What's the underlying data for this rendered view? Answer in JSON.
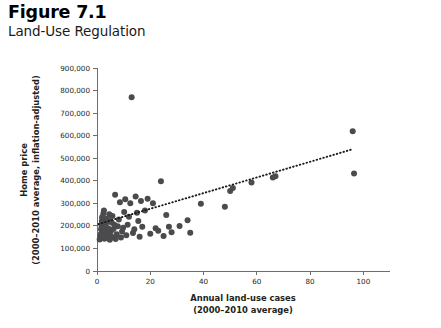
{
  "figure": {
    "number": "Figure 7.1",
    "title": "Land-Use Regulation"
  },
  "chart_data": {
    "type": "scatter",
    "title": "Land-Use Regulation",
    "xlabel_line1": "Annual land-use cases",
    "xlabel_line2": "(2000–2010 average)",
    "ylabel_line1": "Home price",
    "ylabel_line2": "(2000–2010 average, inflation-adjusted)",
    "xlim": [
      0,
      110
    ],
    "ylim": [
      0,
      900000
    ],
    "xticks": [
      0,
      20,
      40,
      60,
      80,
      100
    ],
    "xticklabels": [
      "0",
      "20",
      "40",
      "60",
      "80",
      "100"
    ],
    "yticks": [
      0,
      100000,
      200000,
      300000,
      400000,
      500000,
      600000,
      700000,
      800000,
      900000
    ],
    "yticklabels": [
      "0",
      "100,000",
      "200,000",
      "300,000",
      "400,000",
      "500,000",
      "600,000",
      "700,000",
      "800,000",
      "900,000"
    ],
    "grid": false,
    "legend": false,
    "marker_color": "#4b4b4d",
    "axis_color": "#6d6e71",
    "trendline": {
      "style": "dotted",
      "color": "#1a1a1a",
      "x": [
        0.5,
        96.0
      ],
      "y": [
        208000,
        540000
      ]
    },
    "points": [
      {
        "x": 1.0,
        "y": 140000
      },
      {
        "x": 1.2,
        "y": 152000
      },
      {
        "x": 1.4,
        "y": 163000
      },
      {
        "x": 1.5,
        "y": 185000
      },
      {
        "x": 1.6,
        "y": 205000
      },
      {
        "x": 1.8,
        "y": 222000
      },
      {
        "x": 1.9,
        "y": 238000
      },
      {
        "x": 2.0,
        "y": 148000
      },
      {
        "x": 2.1,
        "y": 172000
      },
      {
        "x": 2.3,
        "y": 196000
      },
      {
        "x": 2.4,
        "y": 255000
      },
      {
        "x": 2.6,
        "y": 268000
      },
      {
        "x": 2.8,
        "y": 143000
      },
      {
        "x": 3.0,
        "y": 158000
      },
      {
        "x": 3.2,
        "y": 180000
      },
      {
        "x": 3.4,
        "y": 212000
      },
      {
        "x": 3.6,
        "y": 232000
      },
      {
        "x": 3.8,
        "y": 146000
      },
      {
        "x": 4.0,
        "y": 168000
      },
      {
        "x": 4.2,
        "y": 190000
      },
      {
        "x": 4.4,
        "y": 225000
      },
      {
        "x": 4.6,
        "y": 252000
      },
      {
        "x": 4.8,
        "y": 138000
      },
      {
        "x": 5.0,
        "y": 155000
      },
      {
        "x": 5.2,
        "y": 176000
      },
      {
        "x": 5.5,
        "y": 215000
      },
      {
        "x": 5.8,
        "y": 244000
      },
      {
        "x": 6.0,
        "y": 150000
      },
      {
        "x": 6.2,
        "y": 186000
      },
      {
        "x": 6.5,
        "y": 205000
      },
      {
        "x": 6.8,
        "y": 338000
      },
      {
        "x": 7.0,
        "y": 142000
      },
      {
        "x": 7.4,
        "y": 163000
      },
      {
        "x": 7.8,
        "y": 198000
      },
      {
        "x": 8.2,
        "y": 228000
      },
      {
        "x": 8.6,
        "y": 305000
      },
      {
        "x": 9.0,
        "y": 148000
      },
      {
        "x": 9.4,
        "y": 175000
      },
      {
        "x": 9.8,
        "y": 192000
      },
      {
        "x": 10.2,
        "y": 262000
      },
      {
        "x": 10.6,
        "y": 318000
      },
      {
        "x": 11.0,
        "y": 158000
      },
      {
        "x": 11.5,
        "y": 205000
      },
      {
        "x": 12.0,
        "y": 240000
      },
      {
        "x": 12.5,
        "y": 300000
      },
      {
        "x": 13.0,
        "y": 770000
      },
      {
        "x": 13.5,
        "y": 168000
      },
      {
        "x": 14.0,
        "y": 185000
      },
      {
        "x": 14.5,
        "y": 330000
      },
      {
        "x": 15.0,
        "y": 258000
      },
      {
        "x": 15.5,
        "y": 222000
      },
      {
        "x": 16.0,
        "y": 152000
      },
      {
        "x": 16.5,
        "y": 310000
      },
      {
        "x": 17.0,
        "y": 196000
      },
      {
        "x": 18.0,
        "y": 268000
      },
      {
        "x": 19.0,
        "y": 320000
      },
      {
        "x": 20.0,
        "y": 165000
      },
      {
        "x": 21.0,
        "y": 300000
      },
      {
        "x": 22.0,
        "y": 190000
      },
      {
        "x": 23.0,
        "y": 178000
      },
      {
        "x": 24.0,
        "y": 398000
      },
      {
        "x": 25.0,
        "y": 155000
      },
      {
        "x": 26.0,
        "y": 248000
      },
      {
        "x": 27.0,
        "y": 196000
      },
      {
        "x": 28.0,
        "y": 172000
      },
      {
        "x": 31.0,
        "y": 200000
      },
      {
        "x": 34.0,
        "y": 225000
      },
      {
        "x": 35.0,
        "y": 170000
      },
      {
        "x": 39.0,
        "y": 298000
      },
      {
        "x": 48.0,
        "y": 285000
      },
      {
        "x": 50.0,
        "y": 355000
      },
      {
        "x": 51.0,
        "y": 368000
      },
      {
        "x": 58.0,
        "y": 392000
      },
      {
        "x": 66.0,
        "y": 415000
      },
      {
        "x": 67.0,
        "y": 420000
      },
      {
        "x": 96.0,
        "y": 620000
      },
      {
        "x": 96.5,
        "y": 432000
      }
    ]
  }
}
